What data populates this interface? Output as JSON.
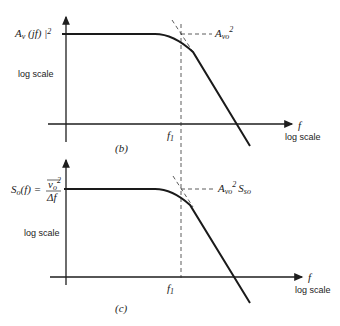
{
  "panels": [
    {
      "id": "b",
      "caption": "(b)",
      "y_label_main": "A",
      "y_label_sub": "v",
      "y_label_rest": " (jf) |",
      "y_label_sup": "2",
      "y_scale": "log scale",
      "x_label": "f",
      "x_scale": "log scale",
      "corner_label": "f",
      "corner_sub": "1",
      "asymptote_label_main": "A",
      "asymptote_label_sub": "vo",
      "asymptote_label_sup": "2",
      "asymptote_label_extra_main": "",
      "asymptote_label_extra_sub": ""
    },
    {
      "id": "c",
      "caption": "(c)",
      "y_label_main": "S",
      "y_label_sub": "o",
      "y_label_rest": "(f) =",
      "y_label_frac_num": "v",
      "y_label_frac_num_sub": "o",
      "y_label_frac_num_sup": "2",
      "y_label_frac_den": "Δf",
      "y_scale": "log scale",
      "x_label": "f",
      "x_scale": "log scale",
      "corner_label": "f",
      "corner_sub": "1",
      "asymptote_label_main": "A",
      "asymptote_label_sub": "vo",
      "asymptote_label_sup": "2",
      "asymptote_label_extra_main": "S",
      "asymptote_label_extra_sub": "so"
    }
  ],
  "colors": {
    "ink": "#1a1a1a",
    "background": "#ffffff"
  }
}
